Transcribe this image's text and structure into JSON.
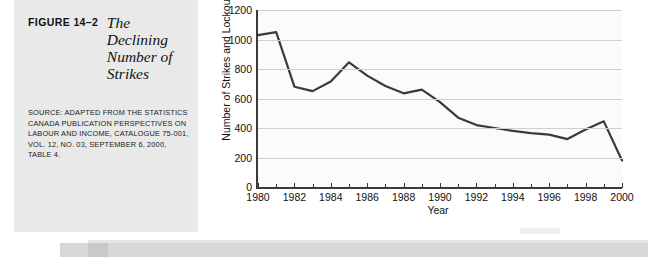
{
  "figure": {
    "number": "FIGURE 14–2",
    "title_lines": [
      "The",
      "Declining",
      "Number of",
      "Strikes"
    ],
    "source_lines": [
      "SOURCE: ADAPTED FROM THE STATISTICS",
      "CANADA PUBLICATION PERSPECTIVES ON",
      "LABOUR AND INCOME, CATALOGUE 75-001,",
      "VOL. 12, NO. 03, SEPTEMBER 6, 2000,",
      "TABLE 4."
    ]
  },
  "chart_data": {
    "type": "line",
    "title": "",
    "xlabel": "Year",
    "ylabel": "Number of Strikes and Lockouts",
    "xlim": [
      1980,
      2000
    ],
    "ylim": [
      0,
      1200
    ],
    "yticks": [
      0,
      200,
      400,
      600,
      800,
      1000,
      1200
    ],
    "xticks": [
      1980,
      1982,
      1984,
      1986,
      1988,
      1990,
      1992,
      1994,
      1996,
      1998,
      2000
    ],
    "xtick_labels": [
      "1980",
      "1982",
      "1984",
      "1986",
      "1988",
      "1990",
      "1992",
      "1994",
      "1996",
      "1998",
      "2000"
    ],
    "ytick_labels": [
      "0",
      "200",
      "400",
      "600",
      "800",
      "1000",
      "1200"
    ],
    "grid": true,
    "legend": "none",
    "series": [
      {
        "name": "Number of Strikes and Lockouts",
        "color": "#3a3a3a",
        "x": [
          1980,
          1981,
          1982,
          1983,
          1984,
          1985,
          1986,
          1987,
          1988,
          1989,
          1990,
          1991,
          1992,
          1993,
          1994,
          1995,
          1996,
          1997,
          1998,
          1999,
          2000
        ],
        "values": [
          1030,
          1050,
          680,
          650,
          715,
          845,
          755,
          685,
          635,
          660,
          575,
          470,
          420,
          400,
          380,
          365,
          355,
          325,
          390,
          445,
          180
        ]
      }
    ]
  },
  "page_artifacts": {
    "edge_note": ""
  }
}
